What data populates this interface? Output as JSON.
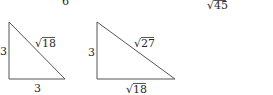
{
  "figure": {
    "top_labels": [
      {
        "text": "6"
      },
      {
        "text": "√45"
      }
    ],
    "triangles": [
      {
        "name": "triangle-1",
        "vertical_leg": "3",
        "horizontal_leg": "3",
        "hypotenuse": "√18"
      },
      {
        "name": "triangle-2",
        "vertical_leg": "3",
        "horizontal_leg": "√18",
        "hypotenuse": "√27"
      }
    ]
  }
}
